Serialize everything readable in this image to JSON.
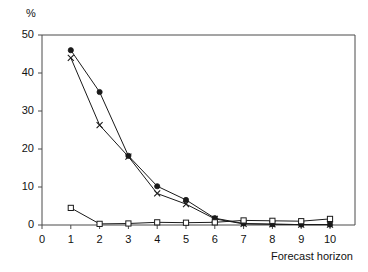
{
  "chart_data": {
    "type": "line",
    "title": "",
    "subtitle": "",
    "xlabel": "Forecast horizon",
    "ylabel": "%",
    "x": [
      1,
      2,
      3,
      4,
      5,
      6,
      7,
      8,
      9,
      10
    ],
    "xlim": [
      0,
      10
    ],
    "ylim": [
      0,
      50
    ],
    "xticks": [
      "0",
      "1",
      "2",
      "3",
      "4",
      "5",
      "6",
      "7",
      "8",
      "9",
      "10"
    ],
    "yticks": [
      "0",
      "10",
      "20",
      "30",
      "40",
      "50"
    ],
    "grid": false,
    "legend": "none",
    "series": [
      {
        "name": "filled-circle-series",
        "marker": "filled-circle",
        "color": "#1a1a1a",
        "values": [
          46.0,
          35.0,
          18.2,
          10.2,
          6.6,
          1.8,
          0.4,
          0.2,
          0.1,
          0.1
        ]
      },
      {
        "name": "cross-series",
        "marker": "cross",
        "color": "#1a1a1a",
        "values": [
          44.0,
          26.3,
          18.0,
          8.3,
          5.5,
          1.6,
          0.3,
          0.2,
          0.1,
          0.1
        ]
      },
      {
        "name": "open-square-series",
        "marker": "open-square",
        "color": "#1a1a1a",
        "values": [
          4.5,
          0.3,
          0.4,
          0.7,
          0.6,
          0.7,
          1.2,
          1.1,
          1.0,
          1.6
        ]
      }
    ],
    "annotations": []
  },
  "labels": {
    "y_unit": "%",
    "x_title": "Forecast horizon"
  }
}
